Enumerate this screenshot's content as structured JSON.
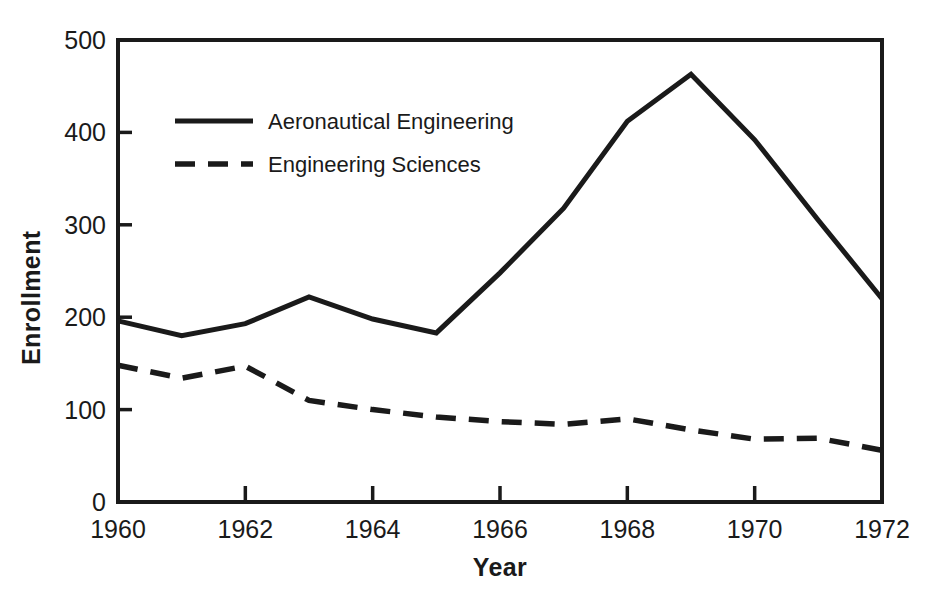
{
  "chart_data": {
    "type": "line",
    "title": "",
    "xlabel": "Year",
    "ylabel": "Enrollment",
    "x": [
      1960,
      1961,
      1962,
      1963,
      1964,
      1965,
      1966,
      1967,
      1968,
      1969,
      1970,
      1971,
      1972
    ],
    "xlim": [
      1960,
      1972
    ],
    "ylim": [
      0,
      500
    ],
    "xticks": [
      1960,
      1962,
      1964,
      1966,
      1968,
      1970,
      1972
    ],
    "xtick_labels": [
      "1960",
      "1962",
      "1964",
      "1966",
      "1968",
      "1970",
      "1972"
    ],
    "yticks": [
      0,
      100,
      200,
      300,
      400,
      500
    ],
    "ytick_labels": [
      "0",
      "100",
      "200",
      "300",
      "400",
      "500"
    ],
    "grid": false,
    "legend_position": "upper-left-inside",
    "series": [
      {
        "name": "Aeronautical Engineering",
        "style": "solid",
        "color": "#1a1a1a",
        "values": [
          196,
          180,
          193,
          222,
          198,
          183,
          248,
          318,
          412,
          463,
          392,
          305,
          220
        ]
      },
      {
        "name": "Engineering Sciences",
        "style": "dashed",
        "color": "#1a1a1a",
        "values": [
          148,
          134,
          147,
          110,
          100,
          92,
          87,
          84,
          90,
          78,
          68,
          69,
          56
        ]
      }
    ]
  },
  "legend": {
    "entries": [
      {
        "label": "Aeronautical Engineering",
        "style": "solid"
      },
      {
        "label": "Engineering Sciences",
        "style": "dashed"
      }
    ]
  },
  "axes": {
    "y_title": "Enrollment",
    "x_title": "Year"
  },
  "colors": {
    "ink": "#1a1a1a",
    "background": "#ffffff"
  }
}
